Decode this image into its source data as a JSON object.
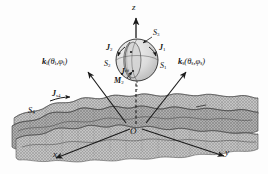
{
  "figure": {
    "type": "scattering-geometry-diagram",
    "background_color": "#fdfdfd",
    "ink_color": "#1a1a1a",
    "surface_fill": "#b9b9b9",
    "sphere_fill": "#d8d8d8"
  },
  "axes": {
    "z": "z",
    "x": "x",
    "y": "y",
    "origin": "O"
  },
  "vectors": {
    "incident": {
      "symbol": "k",
      "sub": "i",
      "args": "(θ",
      "arg_sub1": "i",
      "arg_mid": ",φ",
      "arg_sub2": "i",
      "arg_end": ")"
    },
    "scattered": {
      "symbol": "k",
      "sub": "s",
      "args": "(θ",
      "arg_sub1": "s",
      "arg_mid": ",φ",
      "arg_sub2": "s",
      "arg_end": ")"
    }
  },
  "sphere_labels": {
    "s1": {
      "base": "S",
      "sub": "1"
    },
    "s2": {
      "base": "S",
      "sub": "2"
    },
    "s3": {
      "base": "S",
      "sub": "3"
    },
    "j1": {
      "base": "J",
      "sub": "1"
    },
    "j2": {
      "base": "J",
      "sub": "2"
    },
    "j2eff": {
      "base": "J",
      "sub": "2",
      "sup": "eff"
    },
    "m2": {
      "base": "M",
      "sub": "2"
    }
  },
  "surface_labels": {
    "s4": {
      "base": "S",
      "sub": "4"
    },
    "js4": {
      "base": "J",
      "sub": "s4"
    }
  }
}
